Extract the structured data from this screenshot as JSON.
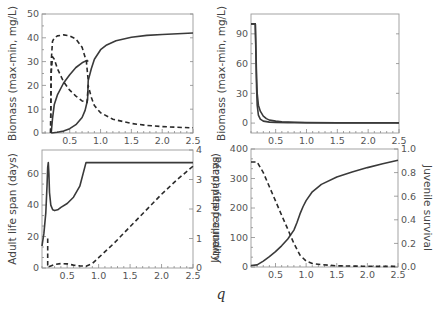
{
  "figure": {
    "x_axis_label": "q"
  },
  "chart_data": [
    {
      "id": "top-left",
      "type": "line",
      "xlabel": "",
      "ylabel": "Biomass (max-min, mg/L)",
      "xlim": [
        0.05,
        2.5
      ],
      "ylim": [
        0,
        50
      ],
      "xticks": [
        0.5,
        1.0,
        1.5,
        2.0,
        2.5
      ],
      "xtick_labels": [
        "0.5",
        "1.0",
        "1.5",
        "2.0",
        "2.5"
      ],
      "yticks": [
        0,
        10,
        20,
        30,
        40,
        50
      ],
      "ytick_labels": [
        "0",
        "10",
        "20",
        "30",
        "40",
        "50"
      ],
      "grid": false,
      "series": [
        {
          "name": "solid-max",
          "style": "solid",
          "x": [
            0.2,
            0.22,
            0.25,
            0.3,
            0.4,
            0.5,
            0.6,
            0.7,
            0.78,
            0.8
          ],
          "y": [
            0,
            6,
            12,
            16,
            21,
            24.5,
            27.5,
            29.5,
            30.5,
            30
          ]
        },
        {
          "name": "solid-min",
          "style": "solid",
          "x": [
            0.2,
            0.3,
            0.4,
            0.5,
            0.6,
            0.7,
            0.75,
            0.79,
            0.8,
            0.85,
            0.9,
            1.0,
            1.1,
            1.25,
            1.5,
            1.75,
            2.0,
            2.25,
            2.5
          ],
          "y": [
            0,
            0.3,
            0.8,
            1.8,
            3.5,
            6.5,
            9.5,
            14,
            22,
            27,
            31,
            35,
            37,
            38.8,
            40.2,
            41,
            41.4,
            41.7,
            42
          ]
        },
        {
          "name": "dashed-max",
          "style": "dashed",
          "x": [
            0.19,
            0.2,
            0.22,
            0.25,
            0.3,
            0.4,
            0.5,
            0.6,
            0.7,
            0.77,
            0.8
          ],
          "y": [
            0,
            30,
            38.5,
            40,
            40.8,
            41.2,
            40.8,
            39.5,
            36,
            30,
            22
          ]
        },
        {
          "name": "dashed-min",
          "style": "dashed",
          "x": [
            0.19,
            0.2,
            0.22,
            0.25,
            0.3,
            0.4,
            0.5,
            0.6,
            0.7,
            0.78,
            0.8,
            0.85,
            0.9,
            1.0,
            1.2,
            1.5,
            1.75,
            2.0,
            2.25,
            2.5
          ],
          "y": [
            0,
            25,
            32,
            31,
            27,
            21.5,
            18,
            15.5,
            13.5,
            12.8,
            20,
            15,
            11.5,
            8.5,
            5.8,
            4,
            3.2,
            2.7,
            2.4,
            2.2
          ]
        }
      ]
    },
    {
      "id": "top-right",
      "type": "line",
      "xlabel": "",
      "ylabel": "Biomass (max-min, mg/L)",
      "xlim": [
        0.1,
        2.5
      ],
      "ylim": [
        -10,
        110
      ],
      "xticks": [
        0.5,
        1.0,
        1.5,
        2.0,
        2.5
      ],
      "xtick_labels": [
        "0.5",
        "1.0",
        "1.5",
        "2.0",
        "2.5"
      ],
      "yticks": [
        0,
        30,
        60,
        90
      ],
      "ytick_labels": [
        "0",
        "30",
        "60",
        "90"
      ],
      "grid": false,
      "series": [
        {
          "name": "solid-a",
          "style": "solid",
          "x": [
            0.1,
            0.17,
            0.18,
            0.19,
            0.2,
            0.22,
            0.25,
            0.3,
            0.4,
            0.5,
            0.7,
            1.0,
            1.5,
            2.0,
            2.5
          ],
          "y": [
            100,
            100,
            70,
            35,
            18,
            8,
            4,
            2,
            1,
            0.7,
            0.5,
            0.3,
            0.2,
            0.2,
            0.2
          ]
        },
        {
          "name": "solid-b",
          "style": "solid",
          "x": [
            0.1,
            0.17,
            0.18,
            0.19,
            0.2,
            0.22,
            0.25,
            0.3,
            0.35,
            0.4,
            0.5,
            0.6,
            0.8,
            1.0,
            1.5,
            2.0,
            2.5
          ],
          "y": [
            100,
            100,
            75,
            45,
            30,
            18,
            12,
            7,
            4.5,
            3,
            2,
            1.3,
            0.8,
            0.5,
            0.3,
            0.3,
            0.3
          ]
        }
      ]
    },
    {
      "id": "bottom-left",
      "type": "line",
      "xlabel": "",
      "ylabel": "Adult life span (days)",
      "ylabel_right": "Per capita fecundity",
      "xlim": [
        0.1,
        2.5
      ],
      "ylim": [
        0,
        75
      ],
      "ylim_right": [
        0,
        4
      ],
      "xticks": [
        0.5,
        1.0,
        1.5,
        2.0,
        2.5
      ],
      "xtick_labels": [
        "0.5",
        "1.0",
        "1.5",
        "2.0",
        "2.5"
      ],
      "yticks": [
        0,
        20,
        40,
        60
      ],
      "ytick_labels": [
        "0",
        "20",
        "40",
        "60"
      ],
      "yticks_right": [
        0,
        1,
        2,
        3,
        4
      ],
      "ytick_labels_right": [
        "0",
        "1",
        "2",
        "3",
        "4"
      ],
      "grid": false,
      "series": [
        {
          "name": "adult-life-span",
          "style": "solid",
          "axis": "left",
          "x": [
            0.1,
            0.13,
            0.16,
            0.18,
            0.19,
            0.2,
            0.21,
            0.22,
            0.24,
            0.27,
            0.3,
            0.35,
            0.4,
            0.5,
            0.6,
            0.7,
            0.8,
            1.0,
            1.5,
            2.0,
            2.5
          ],
          "y": [
            14,
            22,
            35,
            52,
            64,
            67,
            60,
            48,
            40,
            37,
            36.5,
            37,
            38.5,
            41,
            45,
            52,
            67,
            67,
            67,
            67,
            67
          ]
        },
        {
          "name": "per-capita-fecundity",
          "style": "dashed",
          "axis": "right",
          "x": [
            0.19,
            0.19,
            0.2,
            0.22,
            0.3,
            0.4,
            0.5,
            0.6,
            0.7,
            0.8,
            0.9,
            1.0,
            1.25,
            1.5,
            1.75,
            2.0,
            2.25,
            2.5
          ],
          "y": [
            1.0,
            0.1,
            0.02,
            0.05,
            0.12,
            0.15,
            0.14,
            0.1,
            0.07,
            0.06,
            0.15,
            0.35,
            0.85,
            1.4,
            1.95,
            2.5,
            3.0,
            3.45
          ]
        }
      ]
    },
    {
      "id": "bottom-right",
      "type": "line",
      "xlabel": "",
      "ylabel": "Juvenile delay (days)",
      "ylabel_right": "Juvenile survival",
      "xlim": [
        0.1,
        2.5
      ],
      "ylim": [
        0,
        400
      ],
      "ylim_right": [
        0,
        1.0
      ],
      "xticks": [
        0.5,
        1.0,
        1.5,
        2.0,
        2.5
      ],
      "xtick_labels": [
        "0.5",
        "1.0",
        "1.5",
        "2.0",
        "2.5"
      ],
      "yticks": [
        0,
        100,
        200,
        300,
        400
      ],
      "ytick_labels": [
        "0",
        "100",
        "200",
        "300",
        "400"
      ],
      "yticks_right": [
        0,
        0.2,
        0.4,
        0.6,
        0.8,
        1.0
      ],
      "ytick_labels_right": [
        "0.0",
        "0.2",
        "0.4",
        "0.6",
        "0.8",
        "1.0"
      ],
      "grid": false,
      "series": [
        {
          "name": "juvenile-delay",
          "style": "solid",
          "axis": "left",
          "x": [
            0.1,
            0.2,
            0.3,
            0.4,
            0.5,
            0.6,
            0.7,
            0.8,
            0.85,
            0.9,
            0.95,
            1.0,
            1.1,
            1.25,
            1.5,
            1.75,
            2.0,
            2.25,
            2.5
          ],
          "y": [
            5,
            7,
            20,
            35,
            52,
            72,
            95,
            125,
            150,
            180,
            205,
            225,
            255,
            280,
            305,
            322,
            337,
            350,
            362
          ]
        },
        {
          "name": "juvenile-survival",
          "style": "dashed",
          "axis": "right",
          "x": [
            0.1,
            0.2,
            0.3,
            0.4,
            0.5,
            0.6,
            0.7,
            0.8,
            0.9,
            1.0,
            1.1,
            1.25,
            1.5,
            1.75,
            2.0,
            2.5
          ],
          "y": [
            0.89,
            0.89,
            0.8,
            0.68,
            0.56,
            0.44,
            0.32,
            0.2,
            0.1,
            0.05,
            0.03,
            0.02,
            0.01,
            0.008,
            0.006,
            0.005
          ]
        }
      ]
    }
  ],
  "layout": {
    "panels": {
      "top-left": {
        "x0": 42,
        "x1": 193,
        "y0": 133,
        "y1": 14,
        "right_axis": false
      },
      "top-right": {
        "x0": 251,
        "x1": 399,
        "y0": 133,
        "y1": 14,
        "right_axis": false
      },
      "bottom-left": {
        "x0": 42,
        "x1": 193,
        "y0": 268,
        "y1": 150,
        "right_axis": true
      },
      "bottom-right": {
        "x0": 251,
        "x1": 398,
        "y0": 267,
        "y1": 149,
        "right_axis": true
      }
    }
  }
}
